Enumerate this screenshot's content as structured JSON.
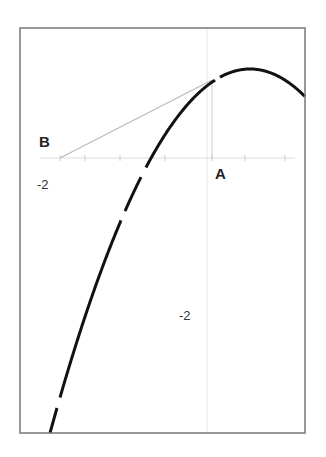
{
  "figure": {
    "title": "",
    "frame": {
      "left": 20,
      "top": 28,
      "right": 305,
      "bottom": 433,
      "color": "#777777"
    },
    "x_axis": {
      "y_px": 158,
      "color": "#dddddd",
      "ticks_px": [
        60,
        85,
        120,
        165,
        212,
        245,
        285
      ]
    },
    "y_axis": {
      "x_px": 207,
      "color": "#e4e4e4"
    },
    "curve": {
      "type": "parabola",
      "vertex_px": [
        250,
        69
      ],
      "a": 0.0091,
      "x_range_px": [
        50,
        305
      ],
      "stroke": "#111111",
      "stroke_width": 3,
      "gaps_x_px": [
        [
          215,
          220
        ],
        [
          141,
          146
        ],
        [
          121,
          125
        ],
        [
          57,
          60
        ]
      ]
    },
    "tangent": {
      "from_px": [
        60,
        158
      ],
      "to_px": [
        212,
        80
      ],
      "color": "#bbbbbb"
    },
    "drop_line": {
      "from_px": [
        212,
        80
      ],
      "to_px": [
        212,
        158
      ],
      "color": "#cccccc"
    },
    "labels": {
      "point_b": "B",
      "point_a": "A",
      "x_tick_label": "-2",
      "y_tick_label": "-2"
    }
  }
}
